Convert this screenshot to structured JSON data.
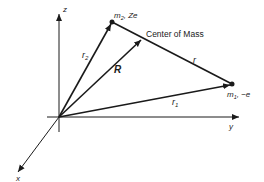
{
  "diagram": {
    "axes": {
      "z_label": "z",
      "y_label": "y",
      "x_label": "x"
    },
    "points": {
      "m2": {
        "label": "m",
        "sub": "2",
        "suffix": ", Ze"
      },
      "m1": {
        "label": "m",
        "sub": "1",
        "suffix": ", −e"
      },
      "center_of_mass": {
        "label": "Center of Mass"
      }
    },
    "vectors": {
      "r2": {
        "label": "r",
        "sub": "2"
      },
      "r1": {
        "label": "r",
        "sub": "1"
      },
      "R": {
        "label": "R"
      },
      "r": {
        "label": "r"
      }
    },
    "colors": {
      "ink": "#1a1a1a",
      "background": "#ffffff"
    }
  }
}
